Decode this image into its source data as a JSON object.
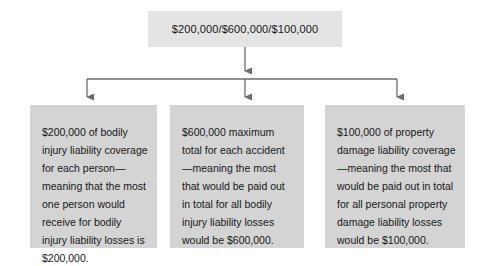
{
  "diagram": {
    "type": "flowchart",
    "orientation": "top-down",
    "colors": {
      "root_fill": "#e4e4e4",
      "leaf_fill": "#d4d4d4",
      "connector": "#6b6b6b",
      "text": "#171717",
      "background": "#ffffff"
    },
    "root": {
      "label": "$200,000/$600,000/$100,000"
    },
    "branches": [
      {
        "id": "bodily-injury-per-person",
        "label": "$200,000 of bodily injury liability coverage for each person—meaning that the most one person would receive for bodily injury liability losses is $200,000."
      },
      {
        "id": "bodily-injury-per-accident",
        "label": "$600,000 maximum total for each accident—meaning the most that would be paid out in total for all bodily injury liability losses would be $600,000."
      },
      {
        "id": "property-damage",
        "label": "$100,000 of property damage liability coverage—meaning the most that would be paid out in total for all personal property damage liability losses would be $100,000."
      }
    ]
  }
}
